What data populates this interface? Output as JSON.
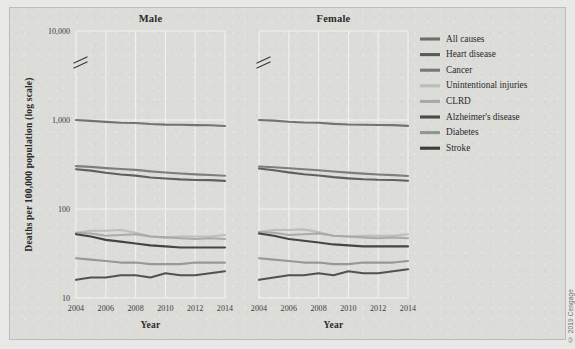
{
  "figure": {
    "credit": "© 2019 Cengage",
    "background_color": "#dcdcd9",
    "border_color": "#bdbdba"
  },
  "chart_data": {
    "type": "line",
    "title": "",
    "xlabel": "Year",
    "ylabel": "Deaths per 100,000 population (log scale)",
    "yscale": "log",
    "ylim": [
      10,
      10000
    ],
    "ytick_labels": [
      "10,000",
      "1,000",
      "100",
      "10"
    ],
    "ytick_values": [
      10000,
      1000,
      100,
      10
    ],
    "xlim": [
      2004,
      2014
    ],
    "xtick_labels": [
      "2004",
      "2006",
      "2008",
      "2010",
      "2012",
      "2014"
    ],
    "xtick_values": [
      2004,
      2006,
      2008,
      2010,
      2012,
      2014
    ],
    "grid": true,
    "axis_break": true,
    "legend_position": "right",
    "panels": [
      {
        "name": "Male",
        "title": "Male",
        "x": [
          2004,
          2005,
          2006,
          2007,
          2008,
          2009,
          2010,
          2011,
          2012,
          2013,
          2014
        ],
        "series": [
          {
            "name": "All causes",
            "values": [
              1000,
              978,
              953,
              931,
              925,
              900,
              887,
              884,
              876,
              872,
              856
            ]
          },
          {
            "name": "Heart disease",
            "values": [
              280,
              270,
              255,
              244,
              237,
              226,
              220,
              215,
              212,
              211,
              207
            ]
          },
          {
            "name": "Cancer",
            "values": [
              303,
              297,
              288,
              281,
              275,
              265,
              257,
              251,
              245,
              241,
              236
            ]
          },
          {
            "name": "Unintentional injuries",
            "values": [
              54,
              57,
              57,
              58,
              54,
              49,
              48,
              49,
              49,
              49,
              51
            ]
          },
          {
            "name": "CLRD",
            "values": [
              54,
              53,
              50,
              51,
              52,
              49,
              48,
              47,
              46,
              47,
              46
            ]
          },
          {
            "name": "Stroke",
            "values": [
              52,
              49,
              45,
              43,
              41,
              39,
              38,
              37,
              37,
              37,
              37
            ]
          },
          {
            "name": "Diabetes",
            "values": [
              28,
              27,
              26,
              25,
              25,
              24,
              24,
              24,
              25,
              25,
              25
            ]
          },
          {
            "name": "Alzheimer's disease",
            "values": [
              16,
              17,
              17,
              18,
              18,
              17,
              19,
              18,
              18,
              19,
              20
            ]
          }
        ]
      },
      {
        "name": "Female",
        "title": "Female",
        "x": [
          2004,
          2005,
          2006,
          2007,
          2008,
          2009,
          2010,
          2011,
          2012,
          2013,
          2014
        ],
        "series": [
          {
            "name": "All causes",
            "values": [
              1000,
              985,
              957,
              938,
              930,
              905,
              890,
              886,
              880,
              876,
              860
            ]
          },
          {
            "name": "Heart disease",
            "values": [
              285,
              272,
              258,
              246,
              238,
              228,
              221,
              216,
              213,
              212,
              208
            ]
          },
          {
            "name": "Cancer",
            "values": [
              300,
              295,
              287,
              280,
              273,
              264,
              256,
              250,
              244,
              240,
              235
            ]
          },
          {
            "name": "Unintentional injuries",
            "values": [
              55,
              58,
              58,
              59,
              55,
              50,
              49,
              50,
              50,
              50,
              52
            ]
          },
          {
            "name": "CLRD",
            "values": [
              55,
              54,
              51,
              52,
              53,
              50,
              49,
              48,
              47,
              48,
              47
            ]
          },
          {
            "name": "Stroke",
            "values": [
              53,
              50,
              46,
              44,
              42,
              40,
              39,
              38,
              38,
              38,
              38
            ]
          },
          {
            "name": "Diabetes",
            "values": [
              28,
              27,
              26,
              25,
              25,
              24,
              24,
              25,
              25,
              25,
              26
            ]
          },
          {
            "name": "Alzheimer's disease",
            "values": [
              16,
              17,
              18,
              18,
              19,
              18,
              20,
              19,
              19,
              20,
              21
            ]
          }
        ]
      }
    ],
    "legend": [
      {
        "label": "All causes",
        "color": "#6d6d6d"
      },
      {
        "label": "Heart disease",
        "color": "#595959"
      },
      {
        "label": "Cancer",
        "color": "#787878"
      },
      {
        "label": "Unintentional injuries",
        "color": "#bcbcbc"
      },
      {
        "label": "CLRD",
        "color": "#a8a8a8"
      },
      {
        "label": "Alzheimer's disease",
        "color": "#4a4a4a"
      },
      {
        "label": "Diabetes",
        "color": "#949494"
      },
      {
        "label": "Stroke",
        "color": "#3c3c3c"
      }
    ]
  }
}
